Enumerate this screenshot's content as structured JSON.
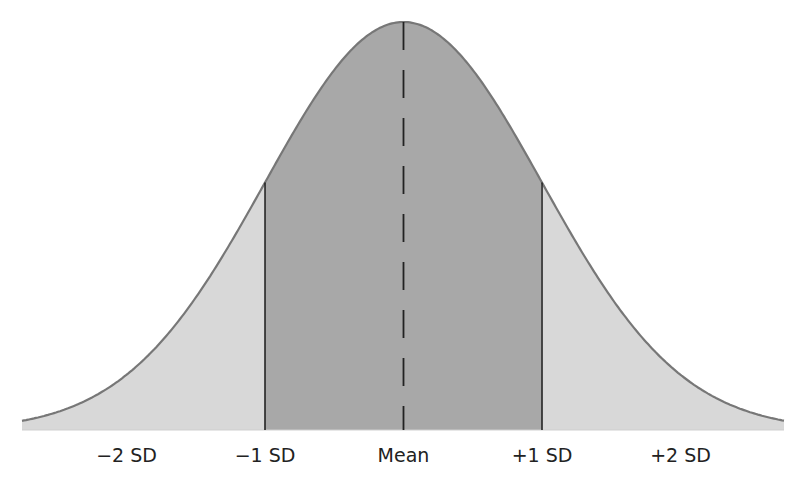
{
  "chart_data": {
    "type": "area",
    "title": "",
    "distribution": "normal",
    "mean": 0,
    "sd": 1,
    "x_ticks": [
      -2,
      -1,
      0,
      1,
      2
    ],
    "tick_labels": [
      "−2 SD",
      "−1 SD",
      "Mean",
      "+1 SD",
      "+2 SD"
    ],
    "shaded_regions": [
      {
        "name": "center",
        "from": -1,
        "to": 1,
        "color": "#a8a8a8"
      },
      {
        "name": "left-tail",
        "from": -3,
        "to": -1,
        "color": "#d8d8d8"
      },
      {
        "name": "right-tail",
        "from": 1,
        "to": 3,
        "color": "#d8d8d8"
      }
    ],
    "reference_lines": [
      {
        "at": -1,
        "style": "solid"
      },
      {
        "at": 0,
        "style": "dashed"
      },
      {
        "at": 1,
        "style": "solid"
      }
    ],
    "xlabel": "",
    "ylabel": "",
    "grid": false
  },
  "colors": {
    "curve": "#777777",
    "center_fill": "#a8a8a8",
    "tail_fill": "#d8d8d8",
    "lines": "#222222",
    "text": "#222222"
  }
}
